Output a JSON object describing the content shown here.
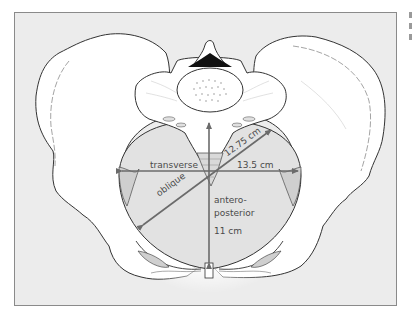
{
  "figure": {
    "colors": {
      "background": "#ececec",
      "frame_border": "#8a8a8a",
      "bone_fill": "#ffffff",
      "outline": "#333333",
      "inlet_fill": "#e2e2e2",
      "arrow": "#6b6b6b",
      "label_text": "#4a4a4a"
    },
    "labels": {
      "transverse": "transverse",
      "transverse_value": "13.5 cm",
      "oblique": "oblique",
      "oblique_value": "12.75 cm",
      "ap_line1": "antero-",
      "ap_line2": "posterior",
      "ap_value": "11 cm"
    }
  },
  "diagram": {
    "nodes": [
      "ilium-left",
      "ilium-right",
      "sacrum",
      "vertebral-body",
      "spinous-process",
      "coccyx",
      "pubic-symphysis",
      "pelvic-inlet"
    ],
    "measurements": [
      {
        "name": "transverse",
        "value_cm": 13.5
      },
      {
        "name": "oblique",
        "value_cm": 12.75
      },
      {
        "name": "antero-posterior",
        "value_cm": 11
      }
    ]
  }
}
